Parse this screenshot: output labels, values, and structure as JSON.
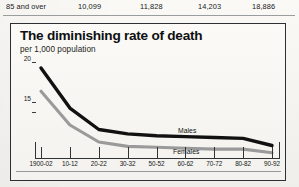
{
  "table": {
    "row": {
      "label": "85 and over",
      "values": [
        "10,099",
        "11,828",
        "14,203",
        "18,886"
      ]
    }
  },
  "chart": {
    "title": "The diminishing rate of death",
    "subtitle": "per 1,000 population",
    "series_labels": {
      "males": "Males",
      "females": "Females"
    }
  },
  "chart_data": {
    "type": "line",
    "title": "The diminishing rate of death",
    "subtitle": "per 1,000 population",
    "xlabel": "",
    "ylabel": "per 1,000 population",
    "ylim": [
      10,
      21
    ],
    "yticks": [
      15,
      20
    ],
    "ytick_labels": [
      "15",
      "20"
    ],
    "grid": false,
    "legend": "inline-labels",
    "categories": [
      "1900-02",
      "10-12",
      "20-22",
      "30-32",
      "50-52",
      "60-62",
      "70-72",
      "80-82",
      "90-92"
    ],
    "series": [
      {
        "name": "Males",
        "color": "#111111",
        "values": [
          20.1,
          15.6,
          13.2,
          12.7,
          12.5,
          12.4,
          12.3,
          12.2,
          11.4
        ]
      },
      {
        "name": "Females",
        "color": "#9a9a9a",
        "values": [
          17.5,
          13.7,
          11.8,
          11.3,
          11.2,
          11.1,
          11.0,
          11.0,
          10.6
        ]
      }
    ]
  }
}
